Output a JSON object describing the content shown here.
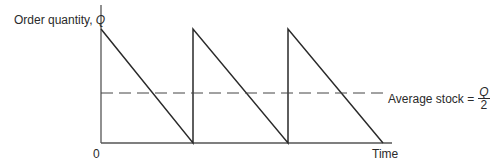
{
  "diagram": {
    "y_axis_label": "Order quantity,",
    "y_axis_symbol": "Q",
    "x_axis_label": "Time",
    "origin_label": "0",
    "average_label": "Average stock =",
    "average_fraction": {
      "numerator": "Q",
      "denominator": "2"
    },
    "colors": {
      "line": "#2a2a2a",
      "axis": "#555555",
      "dashed": "#444444"
    },
    "cycles": 3
  }
}
